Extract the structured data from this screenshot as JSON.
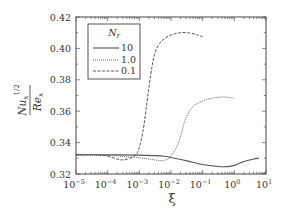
{
  "chart_data": {
    "type": "line",
    "title": "",
    "xlabel": "ξ",
    "ylabel": {
      "numerator_base": "Nu",
      "numerator_sub": "x",
      "denominator_base": "Re",
      "denominator_sub": "x",
      "exponent": "1/2"
    },
    "xscale": "log",
    "xlim": [
      1e-05,
      10
    ],
    "ylim": [
      0.32,
      0.42
    ],
    "x_ticks": [
      {
        "value": 1e-05,
        "base": "10",
        "exp": "−5"
      },
      {
        "value": 0.0001,
        "base": "10",
        "exp": "−4"
      },
      {
        "value": 0.001,
        "base": "10",
        "exp": "−3"
      },
      {
        "value": 0.01,
        "base": "10",
        "exp": "−2"
      },
      {
        "value": 0.1,
        "base": "10",
        "exp": "−1"
      },
      {
        "value": 1,
        "base": "10",
        "exp": "0"
      },
      {
        "value": 10,
        "base": "10",
        "exp": "1"
      }
    ],
    "y_ticks": [
      {
        "value": 0.32,
        "label": "0.32"
      },
      {
        "value": 0.34,
        "label": "0.34"
      },
      {
        "value": 0.36,
        "label": "0.36"
      },
      {
        "value": 0.38,
        "label": "0.38"
      },
      {
        "value": 0.4,
        "label": "0.40"
      },
      {
        "value": 0.42,
        "label": "0.42"
      }
    ],
    "grid": false,
    "legend": {
      "title_base": "N",
      "title_sub": "r",
      "placement": "top-left"
    },
    "series": [
      {
        "name": "10",
        "style": "solid",
        "x": [
          1e-05,
          0.0001,
          0.001,
          0.003,
          0.006,
          0.01,
          0.03,
          0.1,
          0.3,
          0.6,
          1,
          2,
          4,
          6
        ],
        "y": [
          0.3322,
          0.3322,
          0.332,
          0.3317,
          0.3313,
          0.3305,
          0.3285,
          0.326,
          0.3248,
          0.3247,
          0.3255,
          0.328,
          0.3295,
          0.33
        ]
      },
      {
        "name": "1.0",
        "style": "dotted",
        "x": [
          1e-05,
          0.0001,
          0.0005,
          0.001,
          0.003,
          0.005,
          0.008,
          0.01,
          0.015,
          0.02,
          0.03,
          0.05,
          0.1,
          0.2,
          0.4,
          0.7,
          1
        ],
        "y": [
          0.332,
          0.3318,
          0.3308,
          0.3303,
          0.329,
          0.3285,
          0.3295,
          0.3315,
          0.337,
          0.344,
          0.356,
          0.363,
          0.3665,
          0.3683,
          0.369,
          0.3688,
          0.3682
        ]
      },
      {
        "name": "0.1",
        "style": "dashed",
        "x": [
          1e-05,
          5e-05,
          0.0001,
          0.0002,
          0.0003,
          0.0005,
          0.0008,
          0.001,
          0.0013,
          0.0016,
          0.002,
          0.0025,
          0.003,
          0.004,
          0.006,
          0.01,
          0.02,
          0.04,
          0.07,
          0.1
        ],
        "y": [
          0.3325,
          0.3322,
          0.3313,
          0.3295,
          0.329,
          0.33,
          0.3325,
          0.337,
          0.347,
          0.36,
          0.375,
          0.388,
          0.396,
          0.402,
          0.406,
          0.4085,
          0.41,
          0.4098,
          0.4085,
          0.4075
        ]
      }
    ]
  }
}
